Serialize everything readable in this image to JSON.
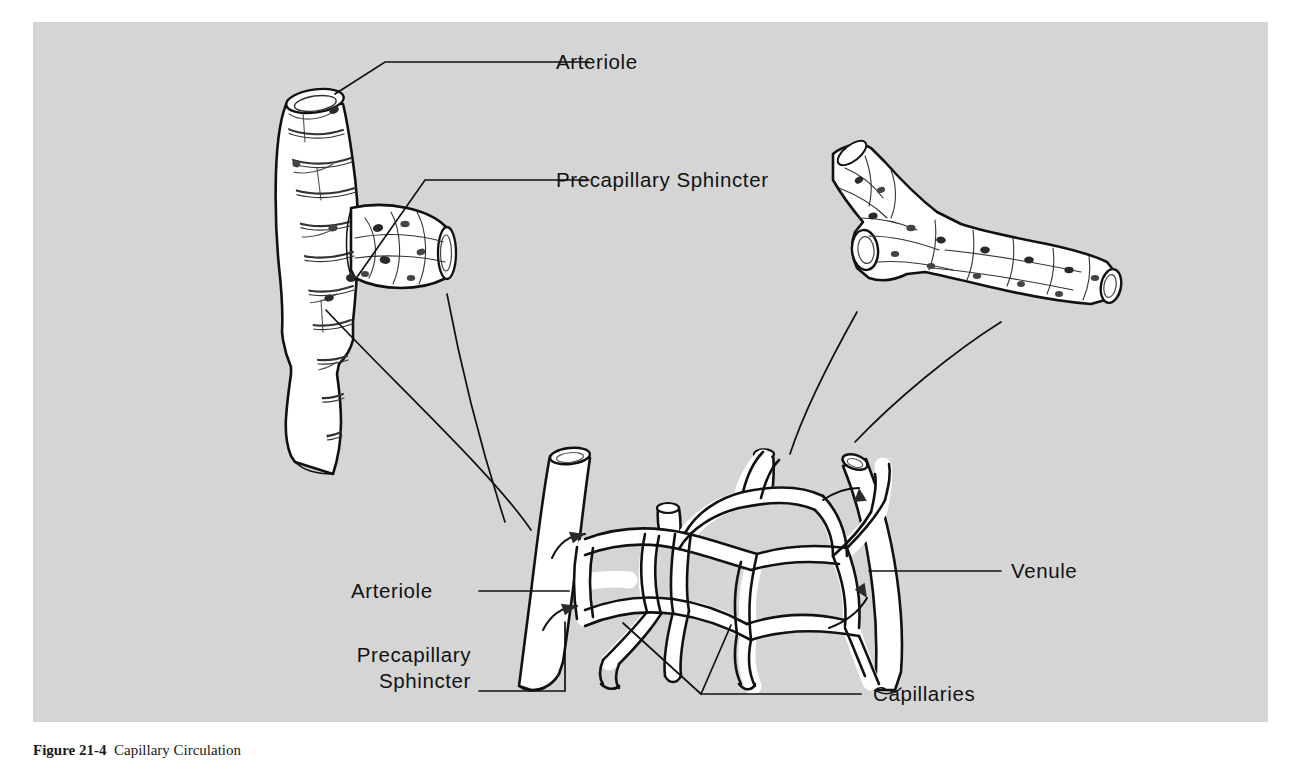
{
  "figure": {
    "caption_number": "Figure 21-4",
    "caption_text": "Capillary Circulation",
    "background_color": "#d5d5d5",
    "ink_color": "#111111",
    "vessel_fill": "#ffffff"
  },
  "labels": {
    "arteriole_top": "Arteriole",
    "precapillary_sphincter_top": "Precapillary Sphincter",
    "arteriole_bed": "Arteriole",
    "precapillary_sphincter_bed_line1": "Precapillary",
    "precapillary_sphincter_bed_line2": "Sphincter",
    "venule": "Venule",
    "capillaries": "Capillaries"
  },
  "structures": {
    "arteriole_detail": {
      "name": "arteriole-detail-illustration",
      "description": "Branching arteriole with spiral smooth muscle bands and a precapillary sphincter at the branch"
    },
    "venule_detail": {
      "name": "venule-detail-illustration",
      "description": "Branching venule with endothelial cell mosaic and thin wall"
    },
    "capillary_bed": {
      "name": "capillary-bed-network",
      "description": "Mesh of anastomosing capillaries joining an arteriole on the left to a venule on the right"
    }
  },
  "flow_arrows": [
    {
      "name": "arteriole-inflow-upper",
      "direction": "into-bed"
    },
    {
      "name": "arteriole-inflow-lower",
      "direction": "into-bed"
    },
    {
      "name": "venule-outflow-upper",
      "direction": "into-venule"
    },
    {
      "name": "venule-outflow-lower",
      "direction": "into-venule"
    }
  ]
}
